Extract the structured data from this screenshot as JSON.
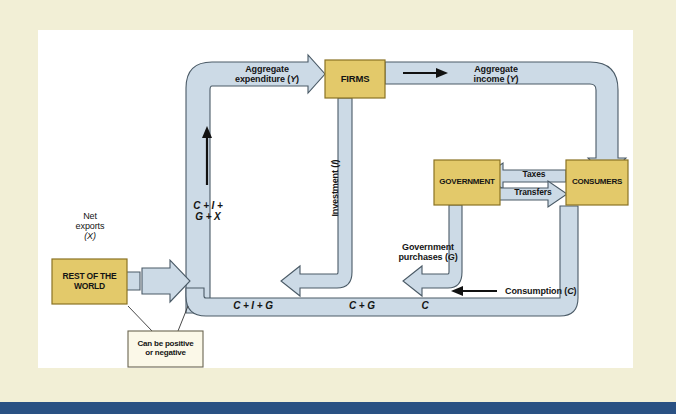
{
  "figure": {
    "type": "diagram"
  },
  "colors": {
    "page_border": "#f2efd6",
    "canvas": "#ffffff",
    "flow_fill": "#ccdae6",
    "flow_stroke": "#4a5a66",
    "sector_box_fill": "#e3c96a",
    "sector_box_stroke": "#8a7324",
    "note_box_fill": "#fbf8e8",
    "note_box_stroke": "#6b6550",
    "text": "#141414",
    "bottom_bar": "#2a5183"
  },
  "sectors": [
    {
      "id": "firms",
      "label": "FIRMS"
    },
    {
      "id": "government",
      "label": "GOVERNMENT"
    },
    {
      "id": "consumers",
      "label": "CONSUMERS"
    },
    {
      "id": "rest_of_world",
      "label_line1": "REST OF THE",
      "label_line2": "WORLD"
    }
  ],
  "note": {
    "line1": "Can be positive",
    "line2": "or negative"
  },
  "flow_labels": {
    "aggregate_expenditure_l1": "Aggregate",
    "aggregate_expenditure_l2": "expenditure (",
    "aggregate_expenditure_var": "Y",
    "aggregate_expenditure_l3": ")",
    "aggregate_income_l1": "Aggregate",
    "aggregate_income_l2": "income (",
    "aggregate_income_var": "Y",
    "aggregate_income_l3": ")",
    "investment_text": "Investment (",
    "investment_var": "I",
    "investment_close": ")",
    "government_purchases_l1": "Government",
    "government_purchases_l2": "purchases (",
    "government_purchases_var": "G",
    "government_purchases_l3": ")",
    "consumption_text": "Consumption (",
    "consumption_var": "C",
    "consumption_close": ")",
    "taxes": "Taxes",
    "transfers": "Transfers",
    "net_exports_l1": "Net",
    "net_exports_l2": "exports",
    "net_exports_l3": "(X)"
  },
  "equation_labels": {
    "cigx_line1": "C + I +",
    "cigx_line2": "G + X",
    "cig": "C + I + G",
    "cg": "C + G",
    "c": "C"
  }
}
